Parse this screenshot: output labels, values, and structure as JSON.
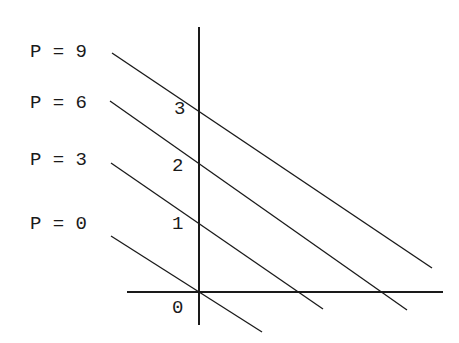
{
  "diagram": {
    "type": "isoprofit-lines",
    "line_labels": [
      {
        "text": "P = 9",
        "value": 9
      },
      {
        "text": "P = 6",
        "value": 6
      },
      {
        "text": "P = 3",
        "value": 3
      },
      {
        "text": "P = 0",
        "value": 0
      }
    ],
    "y_axis_ticks": [
      "3",
      "2",
      "1"
    ],
    "origin_label": "0",
    "colors": {
      "ink": "#1a1a1a",
      "background": "#ffffff"
    }
  }
}
